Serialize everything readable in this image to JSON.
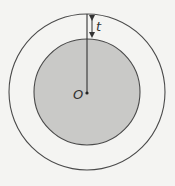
{
  "diagram": {
    "labels": {
      "center": "O",
      "thickness": "t"
    },
    "geometry": {
      "center": [
        87,
        92
      ],
      "outer_radius": 78,
      "inner_radius": 53
    },
    "colors": {
      "background": "#f4f4f2",
      "inner_fill": "#c9c9c7",
      "stroke": "#4a4a4a"
    }
  }
}
